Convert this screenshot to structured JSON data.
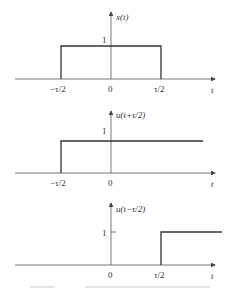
{
  "panels": [
    {
      "name": "rect-pulse",
      "ylabel": "x(t)",
      "xlabel": "t",
      "amplitude_label": "1",
      "ticks": [
        "−τ/2",
        "0",
        "τ/2"
      ],
      "description": "Rectangular pulse of height 1 from −τ/2 to τ/2"
    },
    {
      "name": "advanced-step",
      "ylabel": "u(t+τ/2)",
      "xlabel": "t",
      "amplitude_label": "1",
      "ticks": [
        "−τ/2",
        "0"
      ],
      "description": "Unit step starting at −τ/2"
    },
    {
      "name": "delayed-step",
      "ylabel": "u(t−τ/2)",
      "xlabel": "t",
      "amplitude_label": "1",
      "ticks": [
        "0",
        "τ/2"
      ],
      "description": "Unit step starting at τ/2"
    }
  ]
}
